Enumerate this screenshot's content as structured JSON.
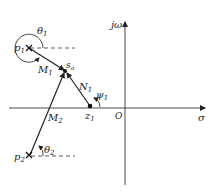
{
  "diagram": {
    "type": "s-plane pole-zero vector diagram",
    "axes": {
      "imag_label": "jω",
      "real_label": "σ",
      "origin_label": "O"
    },
    "poles": [
      {
        "label": "p",
        "sub": "1",
        "marker": "×"
      },
      {
        "label": "p",
        "sub": "2",
        "marker": "×"
      }
    ],
    "zeros": [
      {
        "label": "z",
        "sub": "1",
        "marker": "●"
      }
    ],
    "test_point": {
      "label": "s",
      "sub": "a"
    },
    "vectors": [
      {
        "label": "M",
        "sub": "1",
        "from": "p1",
        "to": "sa"
      },
      {
        "label": "M",
        "sub": "2",
        "from": "p2",
        "to": "sa"
      },
      {
        "label": "N",
        "sub": "1",
        "from": "z1",
        "to": "sa"
      }
    ],
    "angles": [
      {
        "label": "θ",
        "sub": "1",
        "at": "p1"
      },
      {
        "label": "θ",
        "sub": "2",
        "at": "p2"
      },
      {
        "label": "ψ",
        "sub": "1",
        "at": "z1"
      }
    ]
  }
}
